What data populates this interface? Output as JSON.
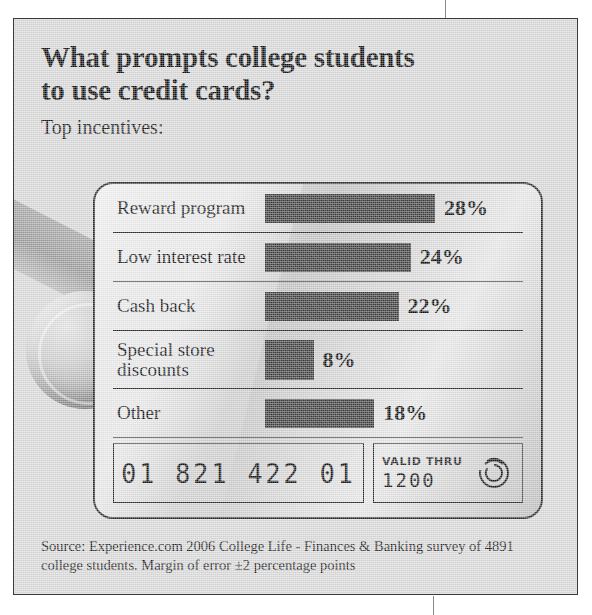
{
  "headline": {
    "line1": "What prompts college students",
    "line2": "to use credit cards?",
    "subhead": "Top incentives:"
  },
  "card": {
    "number": "01 821 422 01",
    "valid_thru_label": "VALID THRU",
    "valid_thru_date": "1200",
    "hologram_icon": "hologram-concentric-arcs-icon"
  },
  "source": {
    "line1": "Source: Experience.com 2006 College Life - Finances & Banking survey",
    "line2": "of 4891 college students. Margin of error ±2 percentage points"
  },
  "colors": {
    "page_background": "#ffffff",
    "panel_background": "#d9d9d9",
    "card_plastic": "#d2d2d2",
    "bar_fill": "#3a3a3a",
    "rule": "#2e2e2e",
    "text": "#111111"
  },
  "chart_data": {
    "type": "bar",
    "title": "What prompts college students to use credit cards?",
    "subtitle": "Top incentives:",
    "orientation": "horizontal",
    "categories": [
      "Reward program",
      "Low interest rate",
      "Cash back",
      "Special store discounts",
      "Other"
    ],
    "category_lines": [
      [
        "Reward program"
      ],
      [
        "Low interest rate"
      ],
      [
        "Cash back"
      ],
      [
        "Special store",
        "discounts"
      ],
      [
        "Other"
      ]
    ],
    "values": [
      28,
      24,
      22,
      8,
      18
    ],
    "value_labels": [
      "28%",
      "24%",
      "22%",
      "8%",
      "18%"
    ],
    "unit": "%",
    "xlabel": "",
    "ylabel": "",
    "xlim": [
      0,
      28
    ],
    "grid": false,
    "legend": null,
    "annotation": "Source: Experience.com 2006 College Life - Finances & Banking survey of 4891 college students. Margin of error ±2 percentage points"
  }
}
